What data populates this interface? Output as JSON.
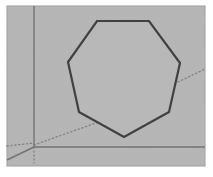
{
  "figure": {
    "canvas": {
      "width": 213,
      "height": 177
    },
    "colors": {
      "page_background": "#ffffff",
      "plane_fill": "#b9b9b9",
      "plane_border": "#9a9a9a",
      "polygon_stroke": "#111111",
      "polygon_fill": "#bcbcbc",
      "axis_line": "#5a5a5a",
      "dotted_line": "#6e6e6e",
      "grain_overlay": "#aeaeae"
    },
    "plane": {
      "name": "background-plane",
      "x": 7,
      "y": 6,
      "width": 198,
      "height": 160
    },
    "polygon": {
      "name": "heptagon",
      "sides": 7,
      "stroke_width": 2.2,
      "vertices": [
        {
          "label": "top-left",
          "x": 97,
          "y": 21
        },
        {
          "label": "top-right",
          "x": 149,
          "y": 21
        },
        {
          "label": "right-upper",
          "x": 180,
          "y": 63
        },
        {
          "label": "right-lower",
          "x": 169,
          "y": 112
        },
        {
          "label": "bottom",
          "x": 124,
          "y": 137
        },
        {
          "label": "left-lower",
          "x": 79,
          "y": 112
        },
        {
          "label": "left-upper",
          "x": 68,
          "y": 62
        }
      ]
    },
    "axes": [
      {
        "name": "vertical-axis",
        "kind": "solid",
        "x1": 34,
        "y1": 6,
        "x2": 34,
        "y2": 147,
        "width": 1.4
      },
      {
        "name": "horizontal-baseline",
        "kind": "solid",
        "x1": 34,
        "y1": 147,
        "x2": 205,
        "y2": 147,
        "width": 1.4
      },
      {
        "name": "depth-axis-left",
        "kind": "solid",
        "x1": 34,
        "y1": 147,
        "x2": 7,
        "y2": 160,
        "width": 1.4
      }
    ],
    "guides": [
      {
        "name": "horizon-guide-left",
        "kind": "dotted",
        "x1": 7,
        "y1": 146,
        "x2": 34,
        "y2": 143,
        "width": 1.3
      },
      {
        "name": "horizon-guide-diagonal",
        "kind": "dotted",
        "x1": 34,
        "y1": 145,
        "x2": 110,
        "y2": 118,
        "width": 1.3
      },
      {
        "name": "horizon-guide-right",
        "kind": "dotted",
        "x1": 178,
        "y1": 82,
        "x2": 205,
        "y2": 69,
        "width": 1.3
      },
      {
        "name": "vertical-drop-guide",
        "kind": "dotted",
        "x1": 34,
        "y1": 147,
        "x2": 34,
        "y2": 163,
        "width": 1.3
      }
    ]
  }
}
